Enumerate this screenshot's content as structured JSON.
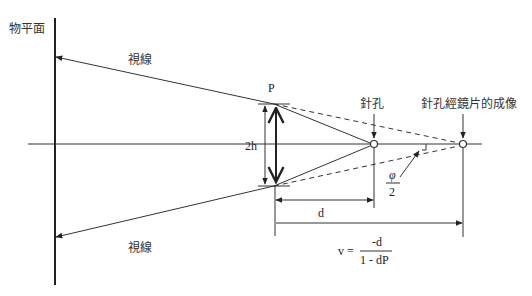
{
  "diagram": {
    "labels": {
      "object_plane": "物平面",
      "sight_line_upper": "視線",
      "sight_line_lower": "視線",
      "lens_power": "P",
      "aperture_height": "2h",
      "pinhole": "針孔",
      "pinhole_image": "針孔經鏡片的成像",
      "angle_numerator": "φ",
      "angle_denominator": "2",
      "distance_d": "d",
      "formula_lhs": "v =",
      "formula_numerator": "-d",
      "formula_denominator": "1 - dP"
    },
    "colors": {
      "line": "#333333",
      "text": "#333333",
      "background": "#ffffff"
    }
  }
}
